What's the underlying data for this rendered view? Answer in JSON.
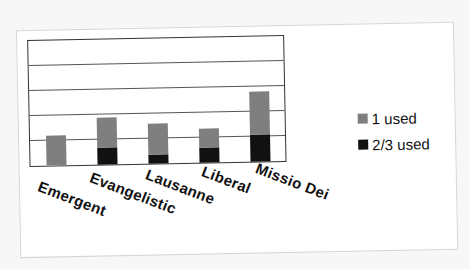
{
  "chart_data": {
    "type": "bar",
    "stacked": true,
    "title": "",
    "xlabel": "",
    "ylabel": "",
    "categories": [
      "Emergent",
      "Evangelistic",
      "Lausanne",
      "Liberal",
      "Missio Dei"
    ],
    "series": [
      {
        "name": "2/3 used",
        "color": "#111111",
        "values": [
          0,
          0.7,
          0.35,
          0.6,
          1.1
        ]
      },
      {
        "name": "1 used",
        "color": "#7f7f7f",
        "values": [
          1.2,
          1.2,
          1.25,
          0.75,
          1.7
        ]
      }
    ],
    "totals": [
      1.2,
      1.9,
      1.6,
      1.35,
      2.8
    ],
    "ylim": [
      0,
      5
    ],
    "ytick_labels_visible": false,
    "grid": true,
    "gridline_count": 4,
    "legend_position": "right",
    "legend": [
      "1 used",
      "2/3 used"
    ]
  },
  "legend": {
    "items": [
      {
        "label": "1 used",
        "color": "#7f7f7f"
      },
      {
        "label": "2/3 used",
        "color": "#111111"
      }
    ]
  },
  "xaxis": {
    "labels": [
      "Emergent",
      "Evangelistic",
      "Lausanne",
      "Liberal",
      "Missio Dei"
    ]
  }
}
